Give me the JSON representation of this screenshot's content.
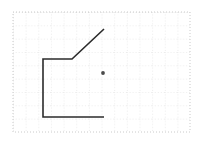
{
  "figure": {
    "title": "",
    "canvas": {
      "width": 200,
      "height": 143,
      "background": "#ffffff"
    },
    "grid": {
      "label": "dashed-square-grid",
      "x_min": 13,
      "y_min": 12,
      "x_max": 190,
      "y_max": 132,
      "cell_width": 12.65,
      "cell_height": 13.33,
      "columns": 14,
      "rows": 9,
      "line_color": "#c9c9c9",
      "dash": "1 2",
      "line_width": 0.7,
      "border_color": "#bdbdbd"
    },
    "polyline": {
      "name": "open-polyline",
      "stroke": "#2b2b2b",
      "stroke_width": 1.6,
      "points": [
        {
          "x": 104,
          "y": 29
        },
        {
          "x": 72,
          "y": 59
        },
        {
          "x": 43,
          "y": 59
        },
        {
          "x": 43,
          "y": 117
        },
        {
          "x": 104,
          "y": 117
        }
      ],
      "points_text": "104,29 72,59 43,59 43,117 104,117"
    },
    "marker": {
      "name": "interior-point",
      "x": 103,
      "y": 73,
      "radius": 1.9,
      "fill": "#4a4a4a"
    }
  }
}
